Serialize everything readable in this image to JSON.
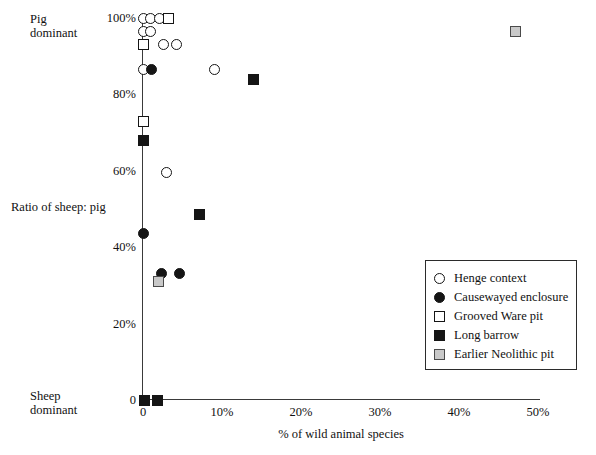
{
  "chart_data": {
    "type": "scatter",
    "title": "",
    "xlabel": "% of wild animal species",
    "ylabel": "Ratio of sheep: pig",
    "xlim": [
      0,
      50
    ],
    "ylim": [
      0,
      100
    ],
    "grid": false,
    "legend_position": "inside-right",
    "y_axis_top_note": "Pig\ndominant",
    "y_axis_bottom_note": "Sheep\ndominant",
    "xticks": [
      "0",
      "10%",
      "20%",
      "30%",
      "40%",
      "50%"
    ],
    "xtick_values": [
      0,
      10,
      20,
      30,
      40,
      50
    ],
    "yticks": [
      "0",
      "20%",
      "40%",
      "60%",
      "80%",
      "100%"
    ],
    "ytick_values": [
      0,
      20,
      40,
      60,
      80,
      100
    ],
    "series": [
      {
        "name": "Henge context",
        "marker": "circle-open",
        "points": [
          {
            "x": 0.0,
            "y": 100.0
          },
          {
            "x": 1.0,
            "y": 100.0
          },
          {
            "x": 2.1,
            "y": 100.0
          },
          {
            "x": 0.0,
            "y": 96.5
          },
          {
            "x": 1.0,
            "y": 96.5
          },
          {
            "x": 2.6,
            "y": 93.0
          },
          {
            "x": 4.3,
            "y": 93.0
          },
          {
            "x": 0.0,
            "y": 86.5
          },
          {
            "x": 9.0,
            "y": 86.5
          },
          {
            "x": 3.0,
            "y": 59.5
          }
        ]
      },
      {
        "name": "Causewayed enclosure",
        "marker": "circle-filled",
        "points": [
          {
            "x": 1.1,
            "y": 86.5
          },
          {
            "x": 0.0,
            "y": 68.0
          },
          {
            "x": 0.0,
            "y": 43.5
          },
          {
            "x": 2.4,
            "y": 33.0
          },
          {
            "x": 4.6,
            "y": 33.0
          }
        ]
      },
      {
        "name": "Grooved Ware pit",
        "marker": "square-open",
        "points": [
          {
            "x": 3.2,
            "y": 100.0
          },
          {
            "x": 0.0,
            "y": 93.0
          },
          {
            "x": 0.0,
            "y": 73.0
          }
        ]
      },
      {
        "name": "Long barrow",
        "marker": "square-filled",
        "points": [
          {
            "x": 14.0,
            "y": 84.0
          },
          {
            "x": 0.0,
            "y": 68.0
          },
          {
            "x": 7.2,
            "y": 48.5
          },
          {
            "x": 0.2,
            "y": 0.0
          },
          {
            "x": 1.8,
            "y": 0.0
          }
        ]
      },
      {
        "name": "Earlier Neolithic pit",
        "marker": "square-grey",
        "points": [
          {
            "x": 47.2,
            "y": 96.5
          },
          {
            "x": 2.0,
            "y": 31.0
          }
        ]
      }
    ]
  },
  "legend": {
    "items": [
      {
        "label": "Henge context",
        "marker": "circle-open"
      },
      {
        "label": "Causewayed enclosure",
        "marker": "circle-filled"
      },
      {
        "label": "Grooved Ware pit",
        "marker": "square-open"
      },
      {
        "label": "Long barrow",
        "marker": "square-filled"
      },
      {
        "label": "Earlier Neolithic pit",
        "marker": "square-grey"
      }
    ]
  },
  "colors": {
    "ink": "#151515",
    "axis": "#3a3a3a",
    "grey_fill": "#c9c9c9",
    "background": "#ffffff"
  }
}
